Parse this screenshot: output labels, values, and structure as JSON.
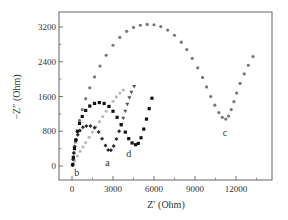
{
  "chart_data": {
    "type": "scatter",
    "title": "",
    "xlabel": "Z′ (Ohm)",
    "ylabel": "−Z″ (Ohm)",
    "xlim": [
      -1000,
      14500
    ],
    "ylim": [
      -400,
      3700
    ],
    "xticks": [
      0,
      3000,
      6000,
      9000,
      12000
    ],
    "yticks": [
      0,
      800,
      1600,
      2400,
      3200
    ],
    "grid": false,
    "legend": "none (curves labeled inline: a, b, c, d)",
    "series": [
      {
        "name": "c",
        "marker": "circle",
        "color": "#777777",
        "label_pos": [
          11200,
          750
        ],
        "points": [
          [
            80,
            50
          ],
          [
            150,
            300
          ],
          [
            250,
            550
          ],
          [
            380,
            800
          ],
          [
            550,
            1050
          ],
          [
            750,
            1300
          ],
          [
            1000,
            1550
          ],
          [
            1300,
            1800
          ],
          [
            1650,
            2050
          ],
          [
            2050,
            2300
          ],
          [
            2500,
            2550
          ],
          [
            3000,
            2780
          ],
          [
            3500,
            2960
          ],
          [
            4000,
            3100
          ],
          [
            4500,
            3190
          ],
          [
            5000,
            3240
          ],
          [
            5500,
            3260
          ],
          [
            6000,
            3250
          ],
          [
            6500,
            3210
          ],
          [
            7000,
            3130
          ],
          [
            7500,
            3010
          ],
          [
            8000,
            2850
          ],
          [
            8400,
            2680
          ],
          [
            8800,
            2480
          ],
          [
            9200,
            2260
          ],
          [
            9550,
            2040
          ],
          [
            9850,
            1820
          ],
          [
            10150,
            1600
          ],
          [
            10450,
            1400
          ],
          [
            10750,
            1230
          ],
          [
            11000,
            1120
          ],
          [
            11250,
            1080
          ],
          [
            11450,
            1150
          ],
          [
            11650,
            1300
          ],
          [
            11850,
            1480
          ],
          [
            12050,
            1680
          ],
          [
            12300,
            1900
          ],
          [
            12600,
            2120
          ],
          [
            12900,
            2320
          ],
          [
            13250,
            2520
          ]
        ]
      },
      {
        "name": "d",
        "marker": "square",
        "color": "#111111",
        "label_pos": [
          4150,
          270
        ],
        "points": [
          [
            50,
            30
          ],
          [
            100,
            200
          ],
          [
            180,
            400
          ],
          [
            280,
            600
          ],
          [
            400,
            800
          ],
          [
            550,
            980
          ],
          [
            750,
            1140
          ],
          [
            1000,
            1280
          ],
          [
            1300,
            1380
          ],
          [
            1650,
            1440
          ],
          [
            2000,
            1460
          ],
          [
            2350,
            1440
          ],
          [
            2700,
            1370
          ],
          [
            3000,
            1260
          ],
          [
            3300,
            1120
          ],
          [
            3600,
            950
          ],
          [
            3900,
            780
          ],
          [
            4150,
            630
          ],
          [
            4400,
            530
          ],
          [
            4650,
            490
          ],
          [
            4850,
            520
          ],
          [
            5050,
            650
          ],
          [
            5250,
            850
          ],
          [
            5450,
            1080
          ],
          [
            5650,
            1320
          ],
          [
            5850,
            1560
          ]
        ]
      },
      {
        "name": "a",
        "marker": "diamond",
        "color": "#2a2a2a",
        "label_pos": [
          2600,
          80
        ],
        "points": [
          [
            40,
            20
          ],
          [
            80,
            150
          ],
          [
            130,
            300
          ],
          [
            200,
            450
          ],
          [
            300,
            600
          ],
          [
            420,
            720
          ],
          [
            580,
            820
          ],
          [
            800,
            890
          ],
          [
            1050,
            920
          ],
          [
            1350,
            920
          ],
          [
            1650,
            880
          ],
          [
            1950,
            780
          ],
          [
            2200,
            630
          ],
          [
            2450,
            470
          ],
          [
            2650,
            370
          ],
          [
            2850,
            360
          ],
          [
            3050,
            460
          ],
          [
            3250,
            620
          ],
          [
            3450,
            800
          ]
        ]
      },
      {
        "name": "a-tail",
        "marker": "triangle-down",
        "color": "#555555",
        "points": [
          [
            3600,
            950
          ],
          [
            3750,
            1100
          ],
          [
            3900,
            1260
          ],
          [
            4050,
            1420
          ],
          [
            4200,
            1570
          ],
          [
            4350,
            1700
          ],
          [
            4550,
            1830
          ]
        ]
      },
      {
        "name": "b",
        "marker": "circle",
        "color": "#bbbbbb",
        "label_pos": [
          350,
          -150
        ],
        "points": [
          [
            60,
            30
          ],
          [
            200,
            120
          ],
          [
            400,
            230
          ],
          [
            600,
            340
          ],
          [
            800,
            440
          ],
          [
            1000,
            540
          ],
          [
            1250,
            660
          ],
          [
            1500,
            780
          ],
          [
            1750,
            900
          ],
          [
            2000,
            1020
          ],
          [
            2250,
            1140
          ],
          [
            2500,
            1260
          ],
          [
            2750,
            1380
          ],
          [
            3000,
            1490
          ],
          [
            3250,
            1590
          ],
          [
            3500,
            1680
          ],
          [
            3750,
            1750
          ]
        ]
      }
    ]
  },
  "labels": {
    "xaxis_title": "Z′ (Ohm)",
    "yaxis_title": "−Z″ (Ohm)",
    "xticks": [
      "0",
      "3000",
      "6000",
      "9000",
      "12000"
    ],
    "yticks": [
      "0",
      "800",
      "1600",
      "2400",
      "3200"
    ]
  }
}
